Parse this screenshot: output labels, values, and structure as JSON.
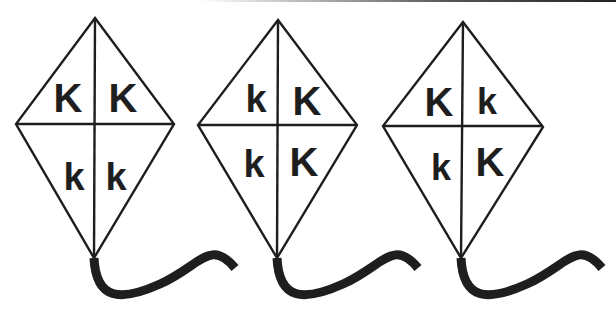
{
  "colors": {
    "stroke": "#1e1e1e",
    "background": "#ffffff"
  },
  "kites": [
    {
      "id": 1,
      "cells": {
        "top_left": "K",
        "top_right": "K",
        "bottom_left": "k",
        "bottom_right": "k"
      }
    },
    {
      "id": 2,
      "cells": {
        "top_left": "k",
        "top_right": "K",
        "bottom_left": "k",
        "bottom_right": "K"
      }
    },
    {
      "id": 3,
      "cells": {
        "top_left": "K",
        "top_right": "k",
        "bottom_left": "k",
        "bottom_right": "K"
      }
    }
  ]
}
